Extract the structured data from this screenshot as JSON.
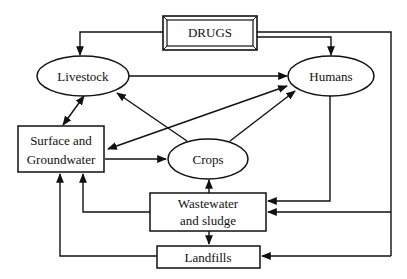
{
  "diagram": {
    "type": "flow",
    "nodes": {
      "drugs": {
        "label": "DRUGS",
        "shape": "double-rect"
      },
      "livestock": {
        "label": "Livestock",
        "shape": "ellipse"
      },
      "humans": {
        "label": "Humans",
        "shape": "ellipse"
      },
      "surface_groundwater": {
        "label_line1": "Surface and",
        "label_line2": "Groundwater",
        "shape": "rect"
      },
      "crops": {
        "label": "Crops",
        "shape": "ellipse"
      },
      "wastewater": {
        "label_line1": "Wastewater",
        "label_line2": "and sludge",
        "shape": "rect"
      },
      "landfills": {
        "label": "Landfills",
        "shape": "rect"
      }
    },
    "edges": [
      {
        "from": "drugs",
        "to": "livestock"
      },
      {
        "from": "drugs",
        "to": "humans"
      },
      {
        "from": "drugs",
        "to": "wastewater"
      },
      {
        "from": "drugs",
        "to": "landfills"
      },
      {
        "from": "livestock",
        "to": "humans"
      },
      {
        "from": "livestock",
        "to": "surface_groundwater",
        "bidirectional": true
      },
      {
        "from": "surface_groundwater",
        "to": "humans",
        "bidirectional": true
      },
      {
        "from": "surface_groundwater",
        "to": "crops"
      },
      {
        "from": "crops",
        "to": "livestock"
      },
      {
        "from": "crops",
        "to": "humans"
      },
      {
        "from": "humans",
        "to": "wastewater"
      },
      {
        "from": "wastewater",
        "to": "crops"
      },
      {
        "from": "wastewater",
        "to": "surface_groundwater"
      },
      {
        "from": "wastewater",
        "to": "landfills"
      },
      {
        "from": "landfills",
        "to": "surface_groundwater"
      }
    ],
    "colors": {
      "stroke": "#111111",
      "background": "#ffffff"
    }
  }
}
